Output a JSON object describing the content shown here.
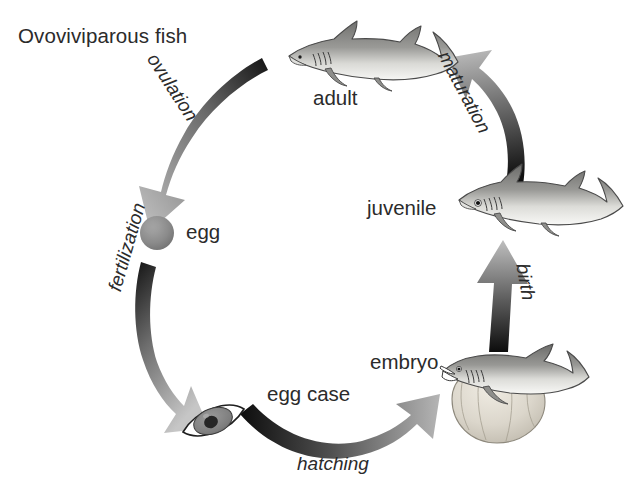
{
  "title": "Ovoviviparous fish",
  "background_color": "#ffffff",
  "text_color": "#2b2b2b",
  "diagram": {
    "type": "life-cycle",
    "direction": "clockwise",
    "stages": [
      {
        "id": "adult",
        "label": "adult",
        "icon": "adult-shark"
      },
      {
        "id": "egg",
        "label": "egg",
        "icon": "egg-sphere"
      },
      {
        "id": "egg_case",
        "label": "egg case",
        "icon": "egg-case-lens"
      },
      {
        "id": "embryo",
        "label": "embryo",
        "icon": "embryo-shark-with-yolk-sac"
      },
      {
        "id": "juvenile",
        "label": "juvenile",
        "icon": "juvenile-shark"
      }
    ],
    "transitions": [
      {
        "id": "ovulation",
        "label": "ovulation",
        "from": "adult",
        "to": "egg",
        "style": "curved-arrow"
      },
      {
        "id": "fertilization",
        "label": "fertilization",
        "from": "egg",
        "to": "egg_case",
        "style": "curved-arrow"
      },
      {
        "id": "hatching",
        "label": "hatching",
        "from": "egg_case",
        "to": "embryo",
        "style": "curved-arrow"
      },
      {
        "id": "birth",
        "label": "birth",
        "from": "embryo",
        "to": "juvenile",
        "style": "straight-arrow"
      },
      {
        "id": "maturation",
        "label": "maturation",
        "from": "juvenile",
        "to": "adult",
        "style": "curved-arrow"
      }
    ]
  },
  "colors": {
    "arrow_dark": "#1a1a1a",
    "arrow_light": "#b9b9b9",
    "fish_body": "#8e8e8e",
    "fish_belly": "#f2f2f2",
    "fish_outline": "#4a4a4a",
    "egg_fill": "#8a8a8a",
    "yolk_fill": "#d8d4cc"
  }
}
